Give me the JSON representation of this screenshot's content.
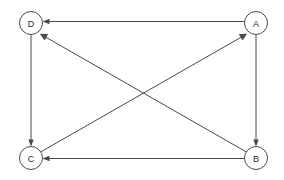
{
  "figure": {
    "kind": "directed-graph",
    "width": 284,
    "height": 180,
    "background_color": "#ffffff",
    "line_color": "#4a4a4a",
    "node_fill_color": "#ffffff",
    "label_color": "#2b2b2b"
  },
  "nodes": [
    {
      "id": "A",
      "label": "A",
      "cx": 256,
      "cy": 23,
      "r": 11.5
    },
    {
      "id": "B",
      "label": "B",
      "cx": 256,
      "cy": 158,
      "r": 11.5
    },
    {
      "id": "C",
      "label": "C",
      "cx": 31,
      "cy": 158,
      "r": 11.5
    },
    {
      "id": "D",
      "label": "D",
      "cx": 31,
      "cy": 23,
      "r": 11.5
    }
  ],
  "edges": [
    {
      "id": "A-D",
      "from": "A",
      "to": "D",
      "directed": true,
      "shape": "horizontal-top"
    },
    {
      "id": "A-B",
      "from": "A",
      "to": "B",
      "directed": true,
      "shape": "vertical-right"
    },
    {
      "id": "B-C",
      "from": "B",
      "to": "C",
      "directed": true,
      "shape": "horizontal-bottom"
    },
    {
      "id": "B-D",
      "from": "B",
      "to": "D",
      "directed": true,
      "shape": "diagonal-up-left"
    },
    {
      "id": "C-A",
      "from": "C",
      "to": "A",
      "directed": true,
      "shape": "diagonal-up-right"
    },
    {
      "id": "D-C",
      "from": "D",
      "to": "C",
      "directed": true,
      "shape": "vertical-left"
    }
  ],
  "labels": {
    "node_a": "A",
    "node_b": "B",
    "node_c": "C",
    "node_d": "D"
  }
}
